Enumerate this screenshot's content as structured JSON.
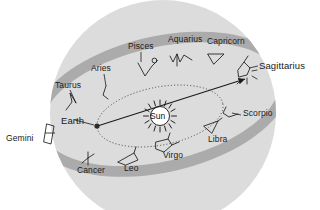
{
  "figure": {
    "type": "astronomy-diagram",
    "background_color": "#ffffff",
    "sphere_color": "#dcdcdc",
    "band_color": "#a8a8a8",
    "line_color": "#1a1a1a"
  },
  "bodies": {
    "sun": {
      "label": "Sun",
      "x": 160,
      "y": 116
    },
    "earth": {
      "label": "Earth",
      "label_x": 61,
      "label_y": 120,
      "dot_x": 97,
      "dot_y": 126
    }
  },
  "sight_line": {
    "from": "Earth",
    "through": "Sun",
    "to": "Sagittarius",
    "arrow": true
  },
  "constellations": [
    {
      "name": "Pisces",
      "label_x": 128,
      "label_y": 46
    },
    {
      "name": "Aquarius",
      "label_x": 168,
      "label_y": 39
    },
    {
      "name": "Capricorn",
      "label_x": 207,
      "label_y": 41
    },
    {
      "name": "Sagittarius",
      "label_x": 259,
      "label_y": 65
    },
    {
      "name": "Scorpio",
      "label_x": 243,
      "label_y": 113
    },
    {
      "name": "Libra",
      "label_x": 208,
      "label_y": 139
    },
    {
      "name": "Virgo",
      "label_x": 163,
      "label_y": 155
    },
    {
      "name": "Leo",
      "label_x": 124,
      "label_y": 168
    },
    {
      "name": "Cancer",
      "label_x": 77,
      "label_y": 170
    },
    {
      "name": "Gemini",
      "label_x": 6,
      "label_y": 138
    },
    {
      "name": "Taurus",
      "label_x": 59,
      "label_y": 85
    },
    {
      "name": "Aries",
      "label_x": 95,
      "label_y": 68
    }
  ]
}
